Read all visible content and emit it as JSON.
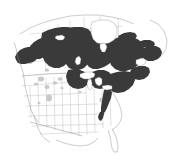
{
  "map": {
    "title": "North American Species Distribution Map",
    "region": "North America",
    "projection": "Lambert Conformal Conic",
    "caption": "",
    "legend": [
      {
        "key": "range",
        "label": "Breeding / resident range",
        "color": "#3a3a3a"
      },
      {
        "key": "scattered",
        "label": "Scattered / isolated populations",
        "color": "#c9c9c9"
      },
      {
        "key": "absent",
        "label": "Absent",
        "color": "#ffffff"
      }
    ],
    "colors": {
      "background": "#ffffff",
      "range_fill": "#3a3a3a",
      "range_fill_light": "#c9c9c9",
      "coastline": "#888888",
      "political_border": "#9a9a9a",
      "state_border": "#b0b0b0"
    },
    "features": {
      "countries": [
        "Canada",
        "United States",
        "Mexico",
        "Greenland"
      ],
      "water_bodies": [
        "Hudson Bay",
        "Great Lakes",
        "Gulf of Mexico",
        "Atlantic Ocean",
        "Pacific Ocean"
      ]
    },
    "range_description": "Continuous dark shading across the boreal belt from interior Alaska and Yukon east through the Canadian Prairies, Ontario, Quebec and the Maritimes to Newfoundland, extending south into the Great Lakes states, New England and along the Appalachian Mountains.",
    "scattered_description": "Small isolated gray patches in the northern Rocky Mountains, northern Great Plains and Upper Midwest."
  }
}
